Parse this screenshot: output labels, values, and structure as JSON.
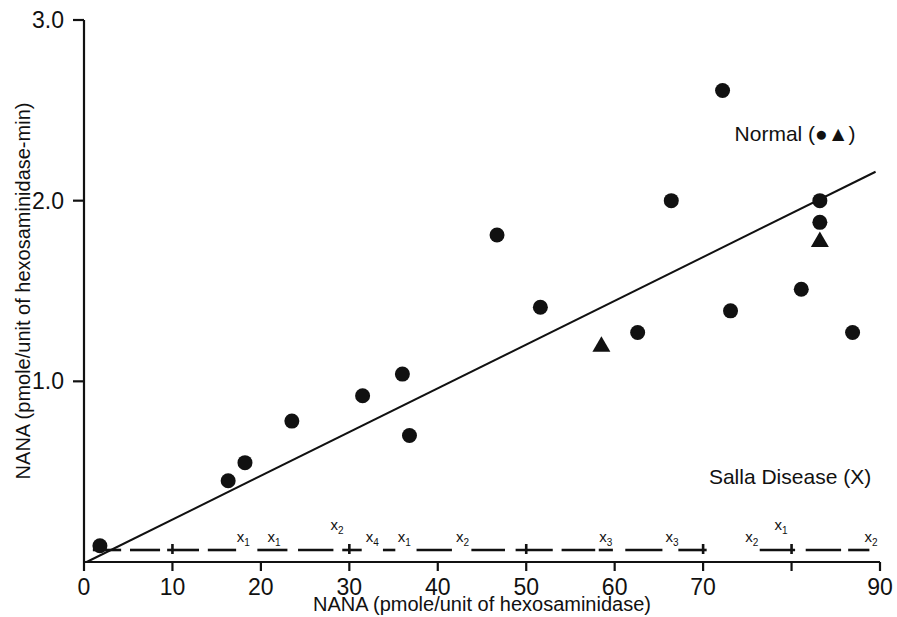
{
  "figure": {
    "background_color": "#ffffff",
    "ink_color": "#111111"
  },
  "chart_data": {
    "type": "scatter",
    "title": "",
    "xlabel": "NANA (pmole/unit of hexosaminidase)",
    "ylabel": "NANA (pmole/unit of hexosaminidase-min)",
    "xlim": [
      0,
      90
    ],
    "ylim": [
      0,
      3.0
    ],
    "xticks": [
      0,
      10,
      20,
      30,
      40,
      50,
      60,
      70,
      80,
      90
    ],
    "xtick_labels": [
      "0",
      "10",
      "20",
      "30",
      "40",
      "50",
      "60",
      "70",
      "",
      "90"
    ],
    "yticks": [
      1.0,
      2.0,
      3.0
    ],
    "ytick_labels": [
      "1.0",
      "2.0",
      "3.0"
    ],
    "grid": false,
    "legend_position": "in-plot",
    "series": [
      {
        "name": "Normal (circles)",
        "label": "Normal (●▲)",
        "marker": "circle",
        "points": [
          [
            1.8,
            0.09
          ],
          [
            16.3,
            0.45
          ],
          [
            18.2,
            0.55
          ],
          [
            23.5,
            0.78
          ],
          [
            31.5,
            0.92
          ],
          [
            36.0,
            1.04
          ],
          [
            36.8,
            0.7
          ],
          [
            46.7,
            1.81
          ],
          [
            51.6,
            1.41
          ],
          [
            62.6,
            1.27
          ],
          [
            66.4,
            2.0
          ],
          [
            72.2,
            2.61
          ],
          [
            73.1,
            1.39
          ],
          [
            81.1,
            1.51
          ],
          [
            83.2,
            2.0
          ],
          [
            83.2,
            1.88
          ],
          [
            86.9,
            1.27
          ]
        ]
      },
      {
        "name": "Normal (triangles)",
        "label": "Normal (●▲)",
        "marker": "triangle",
        "points": [
          [
            58.5,
            1.2
          ],
          [
            83.2,
            1.78
          ]
        ]
      },
      {
        "name": "Salla Disease (X)",
        "label": "Salla Disease (X)",
        "marker": "dashed-line",
        "points": [
          [
            0.0,
            0.0
          ],
          [
            90.0,
            0.0
          ]
        ]
      }
    ],
    "fit_line": {
      "name": "regression-line",
      "x_start": 0.3,
      "y_start": 0.0,
      "x_end": 89.5,
      "y_end": 2.16
    },
    "salla_point_labels": [
      {
        "text": "x",
        "sub": "1",
        "x": 18.0,
        "y_offset": "above"
      },
      {
        "text": "x",
        "sub": "1",
        "x": 21.5,
        "y_offset": "above"
      },
      {
        "text": "x",
        "sub": "2",
        "x": 28.6,
        "y_offset": "high"
      },
      {
        "text": "x",
        "sub": "4",
        "x": 32.6,
        "y_offset": "above"
      },
      {
        "text": "x",
        "sub": "1",
        "x": 36.2,
        "y_offset": "above"
      },
      {
        "text": "x",
        "sub": "2",
        "x": 42.8,
        "y_offset": "above"
      },
      {
        "text": "x",
        "sub": "3",
        "x": 59.0,
        "y_offset": "above"
      },
      {
        "text": "x",
        "sub": "3",
        "x": 66.5,
        "y_offset": "above"
      },
      {
        "text": "x",
        "sub": "2",
        "x": 75.5,
        "y_offset": "above"
      },
      {
        "text": "x",
        "sub": "1",
        "x": 78.8,
        "y_offset": "high"
      },
      {
        "text": "x",
        "sub": "2",
        "x": 89.0,
        "y_offset": "above"
      }
    ],
    "annotations": [
      {
        "name": "normal-series-label",
        "text": "Normal (●▲)",
        "x": 86.0,
        "y": 2.33
      },
      {
        "name": "salla-series-label",
        "text": "Salla Disease (X)",
        "x": 89.0,
        "y": 0.43
      }
    ]
  },
  "axes": {
    "x_title": "NANA (pmole/unit of hexosaminidase)",
    "y_title": "NANA (pmole/unit of hexosaminidase-min)",
    "x_tick_labels": [
      "0",
      "10",
      "20",
      "30",
      "40",
      "50",
      "60",
      "70",
      "90"
    ],
    "y_tick_labels": [
      "1.0",
      "2.0",
      "3.0"
    ]
  },
  "legend": {
    "normal": "Normal (●▲)",
    "salla": "Salla Disease (X)"
  }
}
